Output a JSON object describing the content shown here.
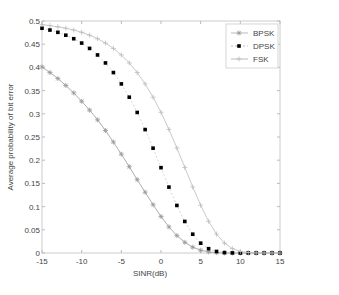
{
  "chart_data": {
    "type": "line",
    "title": "",
    "xlabel": "SINR(dB)",
    "ylabel": "Average probability of bit error",
    "xlim": [
      -15,
      15
    ],
    "ylim": [
      0,
      0.5
    ],
    "xticks": [
      "-15",
      "-10",
      "-5",
      "0",
      "5",
      "10",
      "15"
    ],
    "yticks": [
      "0",
      "0.05",
      "0.1",
      "0.15",
      "0.2",
      "0.25",
      "0.3",
      "0.35",
      "0.4",
      "0.45",
      "0.5"
    ],
    "grid": false,
    "legend_position": "upper right",
    "x": [
      -15,
      -14,
      -13,
      -12,
      -11,
      -10,
      -9,
      -8,
      -7,
      -6,
      -5,
      -4,
      -3,
      -2,
      -1,
      0,
      1,
      2,
      3,
      4,
      5,
      6,
      7,
      8,
      9,
      10,
      11,
      12,
      13,
      14,
      15
    ],
    "series": [
      {
        "name": "BPSK",
        "marker": "star",
        "color": "#999999",
        "values": [
          0.401,
          0.389,
          0.376,
          0.361,
          0.345,
          0.327,
          0.308,
          0.287,
          0.264,
          0.239,
          0.213,
          0.186,
          0.158,
          0.131,
          0.104,
          0.0786,
          0.0562,
          0.0375,
          0.0229,
          0.0125,
          0.006,
          0.0024,
          0.0008,
          0.0002,
          0,
          0,
          0,
          0,
          0,
          0,
          0
        ]
      },
      {
        "name": "DPSK",
        "marker": "dot",
        "color": "#000000",
        "values": [
          0.4844,
          0.4805,
          0.4756,
          0.4694,
          0.4618,
          0.4524,
          0.4409,
          0.4268,
          0.4096,
          0.3889,
          0.3644,
          0.3358,
          0.3029,
          0.266,
          0.2259,
          0.1839,
          0.142,
          0.1025,
          0.068,
          0.0405,
          0.0212,
          0.0093,
          0.0033,
          0.0009,
          0.0002,
          0,
          0,
          0,
          0,
          0,
          0
        ]
      },
      {
        "name": "FSK",
        "marker": "plus",
        "color": "#bbbbbb",
        "values": [
          0.4922,
          0.4901,
          0.4876,
          0.4844,
          0.4805,
          0.4756,
          0.4694,
          0.4618,
          0.4524,
          0.4409,
          0.4268,
          0.4096,
          0.3889,
          0.3644,
          0.3358,
          0.3033,
          0.2664,
          0.2264,
          0.1844,
          0.1424,
          0.1029,
          0.0683,
          0.0408,
          0.0213,
          0.0094,
          0.0034,
          0.0009,
          0.0002,
          0,
          0,
          0
        ]
      }
    ]
  }
}
